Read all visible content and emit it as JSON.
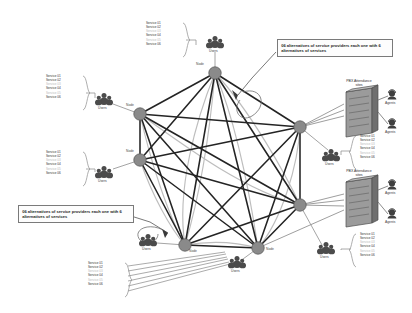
{
  "diagram": {
    "services": {
      "labels": [
        "Service 01",
        "Service 02",
        "Service 03",
        "Service 04",
        "Service 05",
        "Service 06"
      ],
      "dimmed_indices": [
        2,
        4
      ]
    },
    "node_label": "Node",
    "users_label": "Users",
    "agents_label": "Agents",
    "pbx_label": "PBX Attendance\nsites",
    "callouts": [
      {
        "id": "callout-top-right",
        "text": "06 alternatives of service providers each one with 6 alternatives of services"
      },
      {
        "id": "callout-bottom-left",
        "text": "06 alternatives of service providers each one with 6 alternatives of services"
      }
    ],
    "colors": {
      "node_fill": "#8a8a8a",
      "node_stroke": "#5d5d5d",
      "link_dark": "#2a2a2a",
      "link_light": "#b0b0b0",
      "text": "#2b2b2b",
      "text_dim": "#b9b9b9",
      "callout_border": "#7a7a7a",
      "background": "#ffffff"
    },
    "nodes": [
      {
        "id": "n-top",
        "x": 215,
        "y": 73,
        "label": "Node"
      },
      {
        "id": "n-left-upper",
        "x": 140,
        "y": 114,
        "label": "Node"
      },
      {
        "id": "n-left-lower",
        "x": 140,
        "y": 160,
        "label": "Node"
      },
      {
        "id": "n-right-upper",
        "x": 300,
        "y": 127,
        "label": "Node"
      },
      {
        "id": "n-right-lower",
        "x": 300,
        "y": 205,
        "label": "Node"
      },
      {
        "id": "n-bottom-left",
        "x": 185,
        "y": 245,
        "label": "Node"
      },
      {
        "id": "n-bottom-right",
        "x": 258,
        "y": 248,
        "label": "Node"
      }
    ],
    "user_clusters": [
      {
        "id": "users-top",
        "x": 215,
        "y": 45,
        "label": "Users",
        "attached_node": "n-top"
      },
      {
        "id": "users-left-upper",
        "x": 104,
        "y": 101,
        "label": "Users",
        "attached_node": "n-left-upper"
      },
      {
        "id": "users-left-lower",
        "x": 104,
        "y": 172,
        "label": "Users",
        "attached_node": "n-left-lower"
      },
      {
        "id": "users-center-right",
        "x": 328,
        "y": 155,
        "label": "Users",
        "attached_node": "n-right-upper"
      },
      {
        "id": "users-bottom-mid",
        "x": 148,
        "y": 243,
        "label": "Users",
        "attached_node": "n-bottom-left"
      },
      {
        "id": "users-bottom-ctr",
        "x": 239,
        "y": 263,
        "label": "Users",
        "attached_node": "n-bottom-right"
      },
      {
        "id": "users-bottom-right",
        "x": 328,
        "y": 248,
        "label": "Users",
        "attached_node": "n-right-lower"
      }
    ],
    "pbx_sites": [
      {
        "id": "pbx-upper",
        "x": 357,
        "y": 108,
        "label": "PBX Attendance\nsites",
        "agents": [
          {
            "id": "agent-1",
            "x": 392,
            "y": 100,
            "label": "Agents"
          },
          {
            "id": "agent-2",
            "x": 392,
            "y": 127,
            "label": "Agents"
          }
        ]
      },
      {
        "id": "pbx-lower",
        "x": 357,
        "y": 198,
        "label": "PBX Attendance\nsites",
        "agents": [
          {
            "id": "agent-3",
            "x": 392,
            "y": 190,
            "label": "Agents"
          },
          {
            "id": "agent-4",
            "x": 392,
            "y": 216,
            "label": "Agents"
          }
        ]
      }
    ],
    "service_lists": [
      {
        "id": "svc-top",
        "x": 146,
        "y": 22,
        "bracket": "right"
      },
      {
        "id": "svc-left-upper",
        "x": 46,
        "y": 75,
        "bracket": "right"
      },
      {
        "id": "svc-left-lower",
        "x": 46,
        "y": 151,
        "bracket": "right"
      },
      {
        "id": "svc-right-upper",
        "x": 353,
        "y": 135,
        "bracket": "left"
      },
      {
        "id": "svc-right-lower",
        "x": 353,
        "y": 233,
        "bracket": "left"
      },
      {
        "id": "svc-bottom",
        "x": 88,
        "y": 262,
        "bracket": "right"
      }
    ]
  }
}
